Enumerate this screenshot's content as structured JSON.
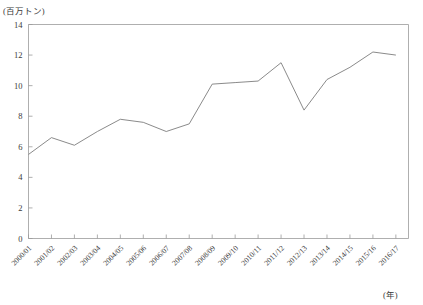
{
  "chart_data": {
    "type": "line",
    "title": "",
    "subtitle": "",
    "xlabel": "(年)",
    "ylabel": "(百万トン)",
    "ylim": [
      0,
      14
    ],
    "yticks": [
      0,
      2,
      4,
      6,
      8,
      10,
      12,
      14
    ],
    "ytick_labels": [
      "0",
      "2",
      "4",
      "6",
      "8",
      "10",
      "12",
      "14"
    ],
    "grid": false,
    "legend": "none",
    "categories": [
      "2000/01",
      "2001/02",
      "2002/03",
      "2003/04",
      "2004/05",
      "2005/06",
      "2006/07",
      "2007/08",
      "2008/09",
      "2009/10",
      "2010/11",
      "2011/12",
      "2012/13",
      "2013/14",
      "2014/15",
      "2015/16",
      "2016/17"
    ],
    "series": [
      {
        "name": "",
        "values": [
          5.5,
          6.6,
          6.1,
          7.0,
          7.8,
          7.6,
          7.0,
          7.5,
          10.1,
          10.2,
          10.3,
          11.5,
          8.4,
          10.4,
          11.2,
          12.2,
          12.0
        ]
      }
    ],
    "colors": {
      "line": "#7d7d7d",
      "axis": "#9a9a9a",
      "text": "#3a3a3a",
      "background": "#ffffff"
    }
  },
  "axis_units": {
    "y_unit": "(百万トン)",
    "x_unit": "(年)"
  }
}
